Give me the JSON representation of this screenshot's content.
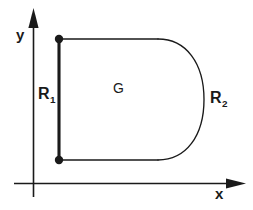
{
  "figure": {
    "background_color": "#ffffff",
    "stroke_color": "#1a1a1a",
    "axes": {
      "y_axis_label": "y",
      "x_axis_label": "x",
      "y_axis_name": "vertical-axis",
      "x_axis_name": "horizontal-axis",
      "arrow_style": "solid-filled-triangle"
    },
    "labels": {
      "r1": {
        "base": "R",
        "subscript": "1"
      },
      "r2": {
        "base": "R",
        "subscript": "2"
      },
      "region": "G"
    },
    "geometry": {
      "boundary_top_y": 39,
      "boundary_bottom_y": 160,
      "boundary_left_x": 59,
      "arc_start_x": 158,
      "arc_max_x": 204,
      "endpoint_markers": 2,
      "endpoint_marker_name": "filled-dot",
      "thick_segment_name": "R1-boundary-segment",
      "arc_name": "R2-boundary-arc"
    }
  }
}
